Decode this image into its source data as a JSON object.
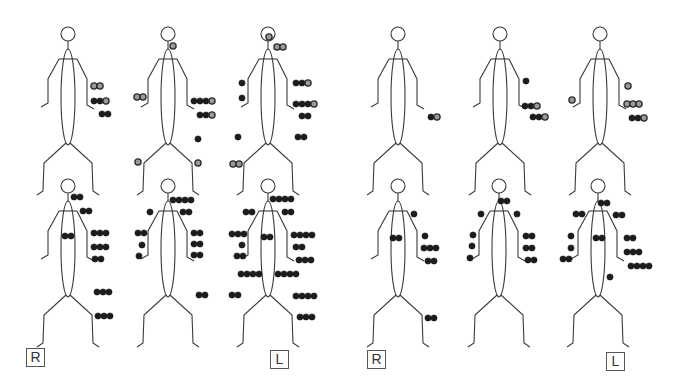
{
  "colors": {
    "line": "#3a3a3a",
    "dot_dark": "#1c1c1c",
    "dot_light_fill": "#9a9a9a",
    "dot_light_stroke": "#2a2a2a",
    "background": "#ffffff"
  },
  "labels": [
    {
      "text": "R",
      "x": 26,
      "y": 348
    },
    {
      "text": "L",
      "x": 270,
      "y": 350
    },
    {
      "text": "R",
      "x": 367,
      "y": 350
    },
    {
      "text": "L",
      "x": 606,
      "y": 352
    }
  ],
  "figures": [
    {
      "id": "top-1",
      "cx": 68,
      "top": 25,
      "dots": [
        {
          "x": 94,
          "y": 86,
          "t": "l"
        },
        {
          "x": 100,
          "y": 86,
          "t": "l"
        },
        {
          "x": 94,
          "y": 101,
          "t": "d"
        },
        {
          "x": 100,
          "y": 101,
          "t": "d"
        },
        {
          "x": 106,
          "y": 101,
          "t": "l"
        },
        {
          "x": 102,
          "y": 114,
          "t": "d"
        },
        {
          "x": 108,
          "y": 114,
          "t": "d"
        }
      ]
    },
    {
      "id": "top-2",
      "cx": 168,
      "top": 25,
      "dots": [
        {
          "x": 173,
          "y": 46,
          "t": "l"
        },
        {
          "x": 137,
          "y": 97,
          "t": "l"
        },
        {
          "x": 143,
          "y": 97,
          "t": "l"
        },
        {
          "x": 194,
          "y": 101,
          "t": "d"
        },
        {
          "x": 200,
          "y": 101,
          "t": "d"
        },
        {
          "x": 206,
          "y": 101,
          "t": "d"
        },
        {
          "x": 212,
          "y": 101,
          "t": "l"
        },
        {
          "x": 200,
          "y": 115,
          "t": "d"
        },
        {
          "x": 206,
          "y": 115,
          "t": "d"
        },
        {
          "x": 212,
          "y": 115,
          "t": "l"
        },
        {
          "x": 198,
          "y": 139,
          "t": "d"
        },
        {
          "x": 138,
          "y": 162,
          "t": "l"
        },
        {
          "x": 198,
          "y": 163,
          "t": "l"
        }
      ]
    },
    {
      "id": "top-3",
      "cx": 268,
      "top": 25,
      "dots": [
        {
          "x": 269,
          "y": 37,
          "t": "l"
        },
        {
          "x": 277,
          "y": 47,
          "t": "l"
        },
        {
          "x": 283,
          "y": 47,
          "t": "l"
        },
        {
          "x": 242,
          "y": 83,
          "t": "d"
        },
        {
          "x": 242,
          "y": 98,
          "t": "d"
        },
        {
          "x": 296,
          "y": 83,
          "t": "d"
        },
        {
          "x": 302,
          "y": 83,
          "t": "d"
        },
        {
          "x": 308,
          "y": 83,
          "t": "l"
        },
        {
          "x": 296,
          "y": 104,
          "t": "d"
        },
        {
          "x": 302,
          "y": 104,
          "t": "d"
        },
        {
          "x": 308,
          "y": 104,
          "t": "d"
        },
        {
          "x": 314,
          "y": 104,
          "t": "l"
        },
        {
          "x": 302,
          "y": 116,
          "t": "d"
        },
        {
          "x": 308,
          "y": 116,
          "t": "d"
        },
        {
          "x": 238,
          "y": 137,
          "t": "d"
        },
        {
          "x": 298,
          "y": 137,
          "t": "d"
        },
        {
          "x": 304,
          "y": 137,
          "t": "d"
        },
        {
          "x": 233,
          "y": 164,
          "t": "l"
        },
        {
          "x": 239,
          "y": 164,
          "t": "l"
        }
      ]
    },
    {
      "id": "top-4",
      "cx": 398,
      "top": 25,
      "dots": [
        {
          "x": 431,
          "y": 117,
          "t": "d"
        },
        {
          "x": 437,
          "y": 117,
          "t": "l"
        }
      ]
    },
    {
      "id": "top-5",
      "cx": 500,
      "top": 25,
      "dots": [
        {
          "x": 526,
          "y": 81,
          "t": "d"
        },
        {
          "x": 525,
          "y": 106,
          "t": "d"
        },
        {
          "x": 531,
          "y": 106,
          "t": "d"
        },
        {
          "x": 537,
          "y": 106,
          "t": "l"
        },
        {
          "x": 533,
          "y": 117,
          "t": "d"
        },
        {
          "x": 539,
          "y": 117,
          "t": "d"
        },
        {
          "x": 545,
          "y": 117,
          "t": "l"
        }
      ]
    },
    {
      "id": "top-6",
      "cx": 600,
      "top": 25,
      "dots": [
        {
          "x": 628,
          "y": 86,
          "t": "l"
        },
        {
          "x": 572,
          "y": 100,
          "t": "l"
        },
        {
          "x": 627,
          "y": 104,
          "t": "l"
        },
        {
          "x": 633,
          "y": 104,
          "t": "l"
        },
        {
          "x": 639,
          "y": 104,
          "t": "l"
        },
        {
          "x": 632,
          "y": 118,
          "t": "d"
        },
        {
          "x": 638,
          "y": 118,
          "t": "d"
        },
        {
          "x": 644,
          "y": 118,
          "t": "l"
        }
      ]
    },
    {
      "id": "bottom-1",
      "cx": 68,
      "top": 177,
      "dots": [
        {
          "x": 74,
          "y": 197,
          "t": "d"
        },
        {
          "x": 80,
          "y": 197,
          "t": "d"
        },
        {
          "x": 83,
          "y": 211,
          "t": "d"
        },
        {
          "x": 89,
          "y": 211,
          "t": "d"
        },
        {
          "x": 65,
          "y": 236,
          "t": "d"
        },
        {
          "x": 71,
          "y": 236,
          "t": "d"
        },
        {
          "x": 94,
          "y": 233,
          "t": "d"
        },
        {
          "x": 100,
          "y": 233,
          "t": "d"
        },
        {
          "x": 106,
          "y": 233,
          "t": "d"
        },
        {
          "x": 94,
          "y": 247,
          "t": "d"
        },
        {
          "x": 100,
          "y": 247,
          "t": "d"
        },
        {
          "x": 106,
          "y": 247,
          "t": "d"
        },
        {
          "x": 95,
          "y": 259,
          "t": "d"
        },
        {
          "x": 101,
          "y": 259,
          "t": "d"
        },
        {
          "x": 97,
          "y": 292,
          "t": "d"
        },
        {
          "x": 103,
          "y": 292,
          "t": "d"
        },
        {
          "x": 109,
          "y": 292,
          "t": "d"
        },
        {
          "x": 98,
          "y": 316,
          "t": "d"
        },
        {
          "x": 104,
          "y": 316,
          "t": "d"
        },
        {
          "x": 110,
          "y": 316,
          "t": "d"
        }
      ]
    },
    {
      "id": "bottom-2",
      "cx": 168,
      "top": 177,
      "dots": [
        {
          "x": 173,
          "y": 200,
          "t": "d"
        },
        {
          "x": 179,
          "y": 200,
          "t": "d"
        },
        {
          "x": 185,
          "y": 200,
          "t": "d"
        },
        {
          "x": 191,
          "y": 200,
          "t": "d"
        },
        {
          "x": 150,
          "y": 212,
          "t": "d"
        },
        {
          "x": 183,
          "y": 212,
          "t": "d"
        },
        {
          "x": 189,
          "y": 212,
          "t": "d"
        },
        {
          "x": 138,
          "y": 233,
          "t": "d"
        },
        {
          "x": 144,
          "y": 233,
          "t": "d"
        },
        {
          "x": 142,
          "y": 245,
          "t": "d"
        },
        {
          "x": 139,
          "y": 256,
          "t": "d"
        },
        {
          "x": 194,
          "y": 233,
          "t": "d"
        },
        {
          "x": 200,
          "y": 233,
          "t": "d"
        },
        {
          "x": 194,
          "y": 244,
          "t": "d"
        },
        {
          "x": 200,
          "y": 244,
          "t": "d"
        },
        {
          "x": 194,
          "y": 255,
          "t": "d"
        },
        {
          "x": 200,
          "y": 255,
          "t": "d"
        },
        {
          "x": 199,
          "y": 295,
          "t": "d"
        },
        {
          "x": 205,
          "y": 295,
          "t": "d"
        }
      ]
    },
    {
      "id": "bottom-3",
      "cx": 268,
      "top": 177,
      "dots": [
        {
          "x": 273,
          "y": 199,
          "t": "d"
        },
        {
          "x": 279,
          "y": 199,
          "t": "d"
        },
        {
          "x": 285,
          "y": 199,
          "t": "d"
        },
        {
          "x": 291,
          "y": 199,
          "t": "d"
        },
        {
          "x": 246,
          "y": 212,
          "t": "d"
        },
        {
          "x": 252,
          "y": 212,
          "t": "d"
        },
        {
          "x": 285,
          "y": 212,
          "t": "d"
        },
        {
          "x": 291,
          "y": 212,
          "t": "d"
        },
        {
          "x": 232,
          "y": 234,
          "t": "d"
        },
        {
          "x": 238,
          "y": 234,
          "t": "d"
        },
        {
          "x": 244,
          "y": 234,
          "t": "d"
        },
        {
          "x": 264,
          "y": 237,
          "t": "d"
        },
        {
          "x": 270,
          "y": 237,
          "t": "d"
        },
        {
          "x": 294,
          "y": 235,
          "t": "d"
        },
        {
          "x": 300,
          "y": 235,
          "t": "d"
        },
        {
          "x": 306,
          "y": 235,
          "t": "d"
        },
        {
          "x": 312,
          "y": 235,
          "t": "d"
        },
        {
          "x": 242,
          "y": 245,
          "t": "d"
        },
        {
          "x": 296,
          "y": 247,
          "t": "d"
        },
        {
          "x": 302,
          "y": 247,
          "t": "d"
        },
        {
          "x": 237,
          "y": 256,
          "t": "d"
        },
        {
          "x": 243,
          "y": 256,
          "t": "d"
        },
        {
          "x": 299,
          "y": 260,
          "t": "d"
        },
        {
          "x": 305,
          "y": 260,
          "t": "d"
        },
        {
          "x": 311,
          "y": 260,
          "t": "d"
        },
        {
          "x": 241,
          "y": 274,
          "t": "d"
        },
        {
          "x": 247,
          "y": 274,
          "t": "d"
        },
        {
          "x": 253,
          "y": 274,
          "t": "d"
        },
        {
          "x": 259,
          "y": 274,
          "t": "d"
        },
        {
          "x": 278,
          "y": 274,
          "t": "d"
        },
        {
          "x": 284,
          "y": 274,
          "t": "d"
        },
        {
          "x": 290,
          "y": 274,
          "t": "d"
        },
        {
          "x": 296,
          "y": 274,
          "t": "d"
        },
        {
          "x": 232,
          "y": 295,
          "t": "d"
        },
        {
          "x": 238,
          "y": 295,
          "t": "d"
        },
        {
          "x": 296,
          "y": 296,
          "t": "d"
        },
        {
          "x": 302,
          "y": 296,
          "t": "d"
        },
        {
          "x": 308,
          "y": 296,
          "t": "d"
        },
        {
          "x": 314,
          "y": 296,
          "t": "d"
        },
        {
          "x": 300,
          "y": 317,
          "t": "d"
        },
        {
          "x": 306,
          "y": 317,
          "t": "d"
        },
        {
          "x": 312,
          "y": 317,
          "t": "d"
        }
      ]
    },
    {
      "id": "bottom-4",
      "cx": 398,
      "top": 177,
      "dots": [
        {
          "x": 414,
          "y": 214,
          "t": "d"
        },
        {
          "x": 393,
          "y": 238,
          "t": "d"
        },
        {
          "x": 399,
          "y": 238,
          "t": "d"
        },
        {
          "x": 425,
          "y": 236,
          "t": "d"
        },
        {
          "x": 424,
          "y": 248,
          "t": "d"
        },
        {
          "x": 430,
          "y": 248,
          "t": "d"
        },
        {
          "x": 436,
          "y": 248,
          "t": "d"
        },
        {
          "x": 428,
          "y": 261,
          "t": "d"
        },
        {
          "x": 434,
          "y": 261,
          "t": "d"
        },
        {
          "x": 428,
          "y": 318,
          "t": "d"
        },
        {
          "x": 434,
          "y": 318,
          "t": "d"
        }
      ]
    },
    {
      "id": "bottom-5",
      "cx": 499,
      "top": 177,
      "dots": [
        {
          "x": 501,
          "y": 201,
          "t": "d"
        },
        {
          "x": 507,
          "y": 201,
          "t": "d"
        },
        {
          "x": 481,
          "y": 214,
          "t": "d"
        },
        {
          "x": 517,
          "y": 214,
          "t": "d"
        },
        {
          "x": 473,
          "y": 235,
          "t": "d"
        },
        {
          "x": 526,
          "y": 236,
          "t": "d"
        },
        {
          "x": 532,
          "y": 236,
          "t": "d"
        },
        {
          "x": 472,
          "y": 246,
          "t": "d"
        },
        {
          "x": 526,
          "y": 248,
          "t": "d"
        },
        {
          "x": 532,
          "y": 248,
          "t": "d"
        },
        {
          "x": 470,
          "y": 258,
          "t": "d"
        },
        {
          "x": 528,
          "y": 260,
          "t": "d"
        },
        {
          "x": 534,
          "y": 260,
          "t": "d"
        }
      ]
    },
    {
      "id": "bottom-6",
      "cx": 598,
      "top": 177,
      "dots": [
        {
          "x": 601,
          "y": 203,
          "t": "d"
        },
        {
          "x": 607,
          "y": 203,
          "t": "d"
        },
        {
          "x": 576,
          "y": 214,
          "t": "d"
        },
        {
          "x": 582,
          "y": 214,
          "t": "d"
        },
        {
          "x": 616,
          "y": 215,
          "t": "d"
        },
        {
          "x": 622,
          "y": 215,
          "t": "d"
        },
        {
          "x": 571,
          "y": 236,
          "t": "d"
        },
        {
          "x": 596,
          "y": 238,
          "t": "d"
        },
        {
          "x": 602,
          "y": 238,
          "t": "d"
        },
        {
          "x": 627,
          "y": 238,
          "t": "d"
        },
        {
          "x": 633,
          "y": 238,
          "t": "d"
        },
        {
          "x": 571,
          "y": 248,
          "t": "d"
        },
        {
          "x": 627,
          "y": 252,
          "t": "d"
        },
        {
          "x": 633,
          "y": 252,
          "t": "d"
        },
        {
          "x": 639,
          "y": 252,
          "t": "d"
        },
        {
          "x": 563,
          "y": 259,
          "t": "d"
        },
        {
          "x": 569,
          "y": 259,
          "t": "d"
        },
        {
          "x": 631,
          "y": 266,
          "t": "d"
        },
        {
          "x": 637,
          "y": 266,
          "t": "d"
        },
        {
          "x": 643,
          "y": 266,
          "t": "d"
        },
        {
          "x": 649,
          "y": 266,
          "t": "d"
        },
        {
          "x": 610,
          "y": 277,
          "t": "d"
        }
      ]
    }
  ]
}
